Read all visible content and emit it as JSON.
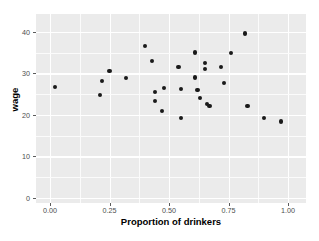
{
  "chart_data": {
    "type": "scatter",
    "title": "",
    "xlabel": "Proportion of drinkers",
    "ylabel": "wage",
    "xlim": [
      0.0,
      1.0
    ],
    "ylim": [
      0,
      42
    ],
    "xticks": [
      "0.00",
      "0.25",
      "0.50",
      "0.75",
      "1.00"
    ],
    "xtick_values": [
      0.0,
      0.25,
      0.5,
      0.75,
      1.0
    ],
    "yticks": [
      "0",
      "10",
      "20",
      "30",
      "40"
    ],
    "ytick_values": [
      0,
      10,
      20,
      30,
      40
    ],
    "grid": true,
    "legend": "none",
    "point_color": "#1a1a1a",
    "panel_color": "#ebebeb",
    "gridline_color": "#ffffff",
    "series": [
      {
        "name": "wage vs proportion of drinkers",
        "points": [
          {
            "x": 0.02,
            "y": 26.8
          },
          {
            "x": 0.21,
            "y": 24.8
          },
          {
            "x": 0.22,
            "y": 28.2
          },
          {
            "x": 0.25,
            "y": 30.5
          },
          {
            "x": 0.32,
            "y": 28.9
          },
          {
            "x": 0.4,
            "y": 36.5
          },
          {
            "x": 0.43,
            "y": 32.9
          },
          {
            "x": 0.44,
            "y": 25.5
          },
          {
            "x": 0.44,
            "y": 23.3
          },
          {
            "x": 0.47,
            "y": 21.0
          },
          {
            "x": 0.48,
            "y": 26.5
          },
          {
            "x": 0.54,
            "y": 31.5
          },
          {
            "x": 0.55,
            "y": 26.3
          },
          {
            "x": 0.55,
            "y": 19.2
          },
          {
            "x": 0.61,
            "y": 35.0
          },
          {
            "x": 0.61,
            "y": 29.0
          },
          {
            "x": 0.62,
            "y": 26.0
          },
          {
            "x": 0.63,
            "y": 24.0
          },
          {
            "x": 0.65,
            "y": 32.4
          },
          {
            "x": 0.65,
            "y": 31.0
          },
          {
            "x": 0.66,
            "y": 22.6
          },
          {
            "x": 0.67,
            "y": 22.2
          },
          {
            "x": 0.72,
            "y": 31.5
          },
          {
            "x": 0.73,
            "y": 27.7
          },
          {
            "x": 0.76,
            "y": 34.9
          },
          {
            "x": 0.82,
            "y": 39.6
          },
          {
            "x": 0.83,
            "y": 22.1
          },
          {
            "x": 0.9,
            "y": 19.3
          },
          {
            "x": 0.97,
            "y": 18.4
          }
        ]
      }
    ]
  }
}
